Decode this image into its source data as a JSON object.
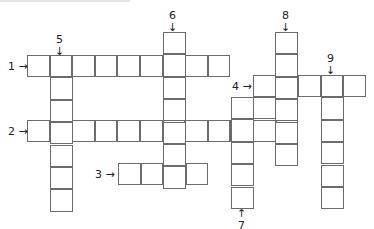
{
  "puzzle": {
    "type": "crossword",
    "cell_size": 22.6,
    "line_color": "#6b6b6b",
    "clues": [
      {
        "number": "1",
        "direction": "across",
        "arrow": "→",
        "length": 9,
        "label_x": 8,
        "label_y": 61,
        "start_x": 27,
        "start_y": 55
      },
      {
        "number": "2",
        "direction": "across",
        "arrow": "→",
        "length": 12,
        "label_x": 8,
        "label_y": 126,
        "start_x": 27,
        "start_y": 120
      },
      {
        "number": "3",
        "direction": "across",
        "arrow": "→",
        "length": 4,
        "label_x": 95,
        "label_y": 169,
        "start_x": 118,
        "start_y": 163
      },
      {
        "number": "4",
        "direction": "across",
        "arrow": "→",
        "length": 5,
        "label_x": 232,
        "label_y": 81,
        "start_x": 253,
        "start_y": 75
      },
      {
        "number": "5",
        "direction": "down",
        "arrow": "↓",
        "length": 7,
        "label_x": 56,
        "label_y": 34,
        "start_x": 50,
        "start_y": 55
      },
      {
        "number": "6",
        "direction": "down",
        "arrow": "↓",
        "length": 7,
        "label_x": 169,
        "label_y": 10,
        "start_x": 163,
        "start_y": 32
      },
      {
        "number": "7",
        "direction": "up",
        "arrow": "↑",
        "length": 5,
        "label_x": 237,
        "label_y": 208,
        "start_x": 231,
        "start_y": 97
      },
      {
        "number": "8",
        "direction": "down",
        "arrow": "↓",
        "length": 6,
        "label_x": 282,
        "label_y": 10,
        "start_x": 275,
        "start_y": 32
      },
      {
        "number": "9",
        "direction": "down",
        "arrow": "↓",
        "length": 6,
        "label_x": 327,
        "label_y": 53,
        "start_x": 321,
        "start_y": 75
      }
    ],
    "extra_cells": [
      {
        "x": 253,
        "y": 97
      }
    ]
  }
}
